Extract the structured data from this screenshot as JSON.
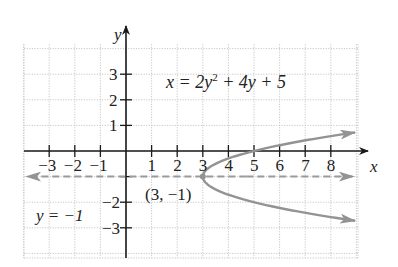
{
  "chart_data": {
    "type": "line",
    "title": "",
    "equation": "x = 2y² + 4y + 5",
    "equation_parts": {
      "lhs": "x = 2y",
      "sup": "2",
      "rhs": " + 4y + 5"
    },
    "xlabel": "x",
    "ylabel": "y",
    "xlim": [
      -4,
      9
    ],
    "ylim": [
      -4,
      4
    ],
    "x_ticks": [
      -3,
      -2,
      -1,
      1,
      2,
      3,
      4,
      5,
      6,
      7,
      8
    ],
    "x_tick_labels": [
      "−3",
      "−2",
      "−1",
      "1",
      "2",
      "3",
      "4",
      "5",
      "6",
      "7",
      "8"
    ],
    "y_ticks": [
      3,
      2,
      1,
      -2,
      -3
    ],
    "y_tick_labels": [
      "3",
      "2",
      "1",
      "−2",
      "−3"
    ],
    "grid": true,
    "series": [
      {
        "name": "x = 2y² + 4y + 5",
        "kind": "parabola opening right",
        "color": "#909090",
        "points": [
          {
            "x": 8.9,
            "y": 0.55
          },
          {
            "x": 5,
            "y": 0
          },
          {
            "x": 3.5,
            "y": -0.5
          },
          {
            "x": 3,
            "y": -1
          },
          {
            "x": 3.5,
            "y": -1.5
          },
          {
            "x": 5,
            "y": -2
          },
          {
            "x": 8.9,
            "y": -2.55
          }
        ]
      },
      {
        "name": "axis of symmetry y = −1",
        "kind": "dashed horizontal line",
        "color": "#909090",
        "points": [
          {
            "x": -4,
            "y": -1
          },
          {
            "x": 9,
            "y": -1
          }
        ]
      }
    ],
    "annotations": [
      {
        "text": "(3, −1)",
        "x": 3,
        "y": -1,
        "label": "vertex"
      },
      {
        "text": "y = −1",
        "label": "axis of symmetry"
      }
    ]
  },
  "labels": {
    "x_axis": "x",
    "y_axis": "y",
    "vertex": "(3, −1)",
    "axis_of_symmetry": "y = −1",
    "equation_lhs": "x = 2y",
    "equation_sup": "2",
    "equation_rhs": " + 4y + 5"
  },
  "colors": {
    "axis": "#1a1a1a",
    "grid": "#c8c8c8",
    "curve": "#939393",
    "dash": "#9a9a9a"
  }
}
